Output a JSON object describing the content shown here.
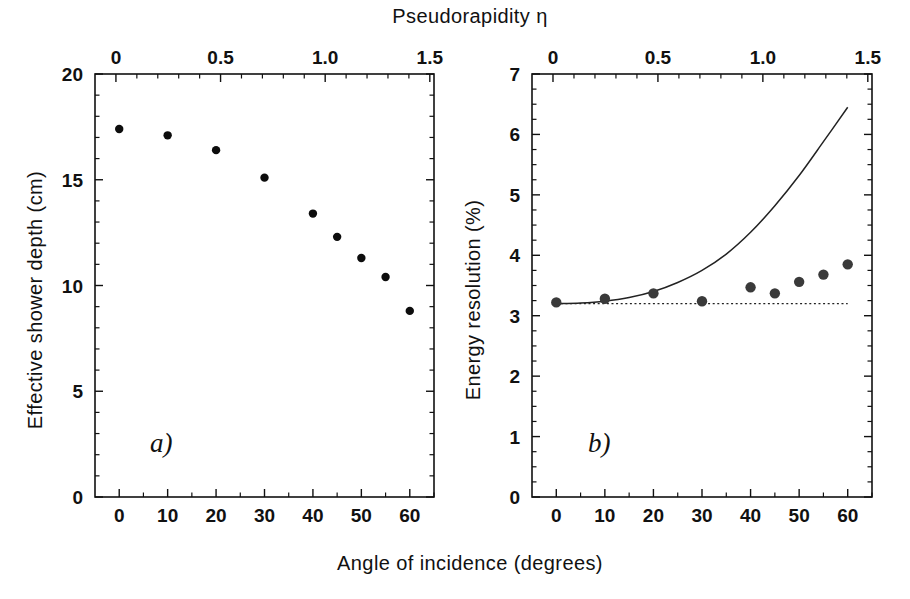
{
  "figure": {
    "top_axis_title": "Pseudorapidity  η",
    "bottom_axis_title": "Angle of incidence (degrees)",
    "panel_a_label": "a)",
    "panel_b_label": "b)",
    "background_color": "#ffffff",
    "ink_color": "#111111"
  },
  "chart_data": [
    {
      "type": "scatter",
      "panel": "a",
      "title": "",
      "xlabel": "Angle of incidence (degrees)",
      "ylabel": "Effective shower depth (cm)",
      "x2label": "Pseudorapidity  η",
      "xlim": [
        -5,
        65
      ],
      "ylim": [
        0,
        20
      ],
      "x2lim": [
        -0.1,
        1.52
      ],
      "grid": false,
      "legend": "none",
      "xticks": [
        0,
        10,
        20,
        30,
        40,
        50,
        60
      ],
      "xticklabels": [
        "0",
        "10",
        "20",
        "30",
        "40",
        "50",
        "60"
      ],
      "yticks": [
        0,
        5,
        10,
        15,
        20
      ],
      "yticklabels": [
        "0",
        "5",
        "10",
        "15",
        "20"
      ],
      "x2ticks": [
        0,
        0.5,
        1.0,
        1.5
      ],
      "x2ticklabels": [
        "0",
        "0.5",
        "1.0",
        "1.5"
      ],
      "y_minor_step": 1,
      "x_minor_step": 5,
      "series": [
        {
          "name": "Effective shower depth",
          "marker": "filled-circle",
          "color": "#0d0d0d",
          "x": [
            0,
            10,
            20,
            30,
            40,
            45,
            50,
            55,
            60
          ],
          "y": [
            17.4,
            17.1,
            16.4,
            15.1,
            13.4,
            12.3,
            11.3,
            10.4,
            8.8
          ]
        }
      ]
    },
    {
      "type": "scatter",
      "panel": "b",
      "title": "",
      "xlabel": "Angle of incidence (degrees)",
      "ylabel": "Energy resolution (%)",
      "x2label": "Pseudorapidity  η",
      "xlim": [
        -5,
        65
      ],
      "ylim": [
        0,
        7
      ],
      "x2lim": [
        -0.1,
        1.52
      ],
      "grid": false,
      "legend": "none",
      "xticks": [
        0,
        10,
        20,
        30,
        40,
        50,
        60
      ],
      "xticklabels": [
        "0",
        "10",
        "20",
        "30",
        "40",
        "50",
        "60"
      ],
      "yticks": [
        0,
        1,
        2,
        3,
        4,
        5,
        6,
        7
      ],
      "yticklabels": [
        "0",
        "1",
        "2",
        "3",
        "4",
        "5",
        "6",
        "7"
      ],
      "x2ticks": [
        0,
        0.5,
        1.0,
        1.5
      ],
      "x2ticklabels": [
        "0",
        "0.5",
        "1.0",
        "1.5"
      ],
      "y_minor_step": 0.25,
      "x_minor_step": 5,
      "series": [
        {
          "name": "Measured energy resolution",
          "marker": "filled-circle",
          "color": "#3a3a3a",
          "x": [
            0,
            10,
            20,
            30,
            40,
            45,
            50,
            55,
            60
          ],
          "y": [
            3.22,
            3.28,
            3.37,
            3.24,
            3.47,
            3.37,
            3.56,
            3.68,
            3.85
          ]
        },
        {
          "name": "Model curve",
          "marker": "none",
          "style": "solid",
          "color": "#222222",
          "x": [
            0,
            5,
            10,
            15,
            20,
            25,
            30,
            35,
            40,
            45,
            50,
            55,
            60
          ],
          "y": [
            3.2,
            3.21,
            3.24,
            3.3,
            3.4,
            3.55,
            3.75,
            4.02,
            4.38,
            4.82,
            5.32,
            5.88,
            6.45
          ]
        },
        {
          "name": "Reference resolution (constant)",
          "marker": "none",
          "style": "dotted",
          "color": "#222222",
          "x": [
            0,
            60
          ],
          "y": [
            3.2,
            3.2
          ]
        }
      ]
    }
  ]
}
